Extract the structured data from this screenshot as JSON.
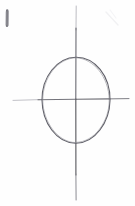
{
  "canvas": {
    "width": 135,
    "height": 206,
    "background_color": "#fefefe",
    "medium": "pencil-on-paper",
    "title": "Hand-drawn ellipse on crossed axes"
  },
  "palette": {
    "paper": "#fefefe",
    "graphite_dark": "#555558",
    "graphite_mid": "#74747a",
    "graphite_light": "#9a9aa0",
    "graphite_faint": "#c8c8cd"
  },
  "figure": {
    "name": "ellipse-with-axes",
    "center": {
      "x": 76,
      "y": 99
    },
    "ellipse": {
      "label": "ellipse",
      "center_x": 76,
      "center_y": 100,
      "radius_x": 34,
      "radius_y": 43,
      "left_extreme_x": 42,
      "right_extreme_x": 110,
      "top_extreme_y": 57,
      "bottom_extreme_y": 143,
      "stroke_color": "#61616a",
      "stroke_width": 1.1
    },
    "vertical_axis": {
      "label": "vertical-axis",
      "x": 76,
      "y_start": 6,
      "y_end": 200,
      "stroke_color": "#646469",
      "stroke_width": 1.1
    },
    "horizontal_axis": {
      "label": "horizontal-axis",
      "y": 99,
      "x_start": 13,
      "x_end": 129,
      "stroke_color": "#6e6e75",
      "stroke_width": 1.0
    }
  },
  "marks": {
    "corner_tick": {
      "label": "corner-tick-mark",
      "x": 7,
      "y_start": 10,
      "y_end": 26,
      "stroke_color": "#7a7a80",
      "stroke_width": 2.6
    },
    "faint_smudge": {
      "label": "faint-smudge",
      "x": 112,
      "y": 18,
      "stroke_color": "#ececef"
    }
  }
}
